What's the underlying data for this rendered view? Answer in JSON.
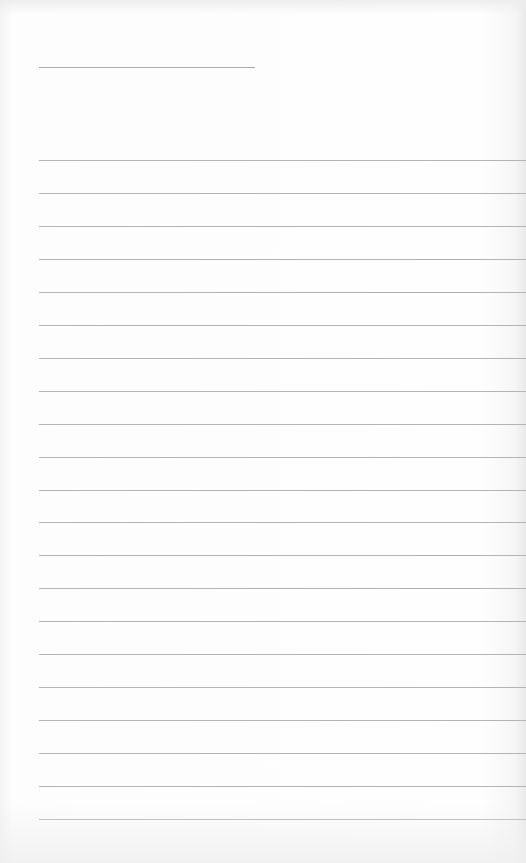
{
  "document": {
    "type": "blank lined writing paper",
    "title_line": {
      "filled_text": ""
    },
    "ruled_lines": {
      "count": 21,
      "filled_text": [
        "",
        "",
        "",
        "",
        "",
        "",
        "",
        "",
        "",
        "",
        "",
        "",
        "",
        "",
        "",
        "",
        "",
        "",
        "",
        "",
        ""
      ]
    }
  },
  "colors": {
    "paper": "#fbfbfb",
    "rule": "#b4b4b4",
    "title_rule": "#a9a9a9"
  }
}
